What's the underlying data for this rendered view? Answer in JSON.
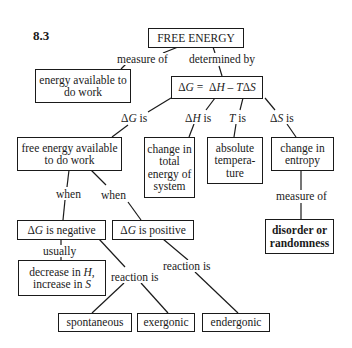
{
  "figure_number": "8.3",
  "nodes": {
    "free_energy": "FREE ENERGY",
    "energy_available": "energy available to do work",
    "equation": "ΔG = ΔH − TΔS",
    "free_energy_available": "free energy available to do work",
    "change_total_energy": "change in total energy of system",
    "absolute_temperature": "absolute tempera-ture",
    "change_entropy": "change in entropy",
    "disorder": "disorder or randomness",
    "dg_negative": "ΔG is negative",
    "dg_positive": "ΔG is positive",
    "decrease_increase": "decrease in H, increase in S",
    "spontaneous": "spontaneous",
    "exergonic": "exergonic",
    "endergonic": "endergonic"
  },
  "links": {
    "measure_of_1": "measure of",
    "determined_by": "determined by",
    "dg_is": "ΔG is",
    "dh_is": "ΔH is",
    "t_is": "T is",
    "ds_is": "ΔS is",
    "when_1": "when",
    "when_2": "when",
    "measure_of_2": "measure of",
    "usually": "usually",
    "reaction_is_1": "reaction is",
    "reaction_is_2": "reaction is"
  }
}
